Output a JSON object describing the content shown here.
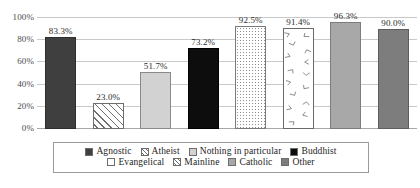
{
  "chart_data": {
    "type": "bar",
    "title": "",
    "subtitle": "",
    "xlabel": "",
    "ylabel": "",
    "ylim": [
      0,
      100
    ],
    "grid": true,
    "legend_position": "bottom",
    "y_ticks": [
      "100%",
      "80%",
      "60%",
      "40%",
      "20%",
      "0%"
    ],
    "y_tick_values": [
      100,
      80,
      60,
      40,
      20,
      0
    ],
    "categories": [
      "Agnostic",
      "Atheist",
      "Nothing in particular",
      "Buddhist",
      "Evangelical",
      "Mainline",
      "Catholic",
      "Other"
    ],
    "values": [
      83.3,
      23.0,
      51.7,
      73.2,
      92.5,
      91.4,
      96.3,
      90.0
    ],
    "data_labels": [
      "83.3%",
      "23.0%",
      "51.7%",
      "73.2%",
      "92.5%",
      "91.4%",
      "96.3%",
      "90.0%"
    ],
    "bar_styles": [
      "solid-dark",
      "diagonal-hatch",
      "solid-light-gray",
      "solid-black",
      "white-dotted",
      "white-arrow-pattern",
      "solid-mid-gray",
      "solid-dark-gray"
    ],
    "colors": {
      "agnostic": "#3f3f3f",
      "atheist": "#ffffff",
      "nothing_in_particular": "#d2d2d2",
      "buddhist": "#0d0d0d",
      "evangelical": "#ffffff",
      "mainline": "#ffffff",
      "catholic": "#a8a8a8",
      "other": "#7d7d7d",
      "gridline": "#c9c9c9",
      "axis_text": "#4c4c4c",
      "label_text": "#2b2b2b"
    }
  },
  "legend": {
    "rows": [
      [
        {
          "label": "Agnostic",
          "swatch": "solid-dark"
        },
        {
          "label": "Atheist",
          "swatch": "diagonal-hatch"
        },
        {
          "label": "Nothing in particular",
          "swatch": "solid-light-gray"
        },
        {
          "label": "Buddhist",
          "swatch": "solid-black"
        }
      ],
      [
        {
          "label": "Evangelical",
          "swatch": "white"
        },
        {
          "label": "Mainline",
          "swatch": "diagonal-hatch"
        },
        {
          "label": "Catholic",
          "swatch": "solid-mid-gray"
        },
        {
          "label": "Other",
          "swatch": "solid-dark-gray"
        }
      ]
    ]
  }
}
